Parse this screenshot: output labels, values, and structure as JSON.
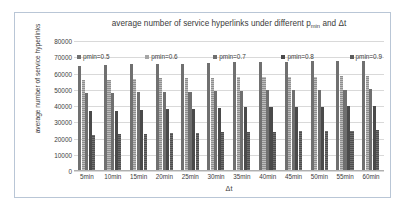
{
  "chart_data": {
    "type": "bar",
    "title": "average number of service hyperlinks under different p",
    "title_sub": "min",
    "title_tail": " and Δt",
    "title_full": "average number of service hyperlinks under different pmin and Δt",
    "xlabel": "Δt",
    "ylabel": "average number of service hyperlinks",
    "categories": [
      "5min",
      "10min",
      "15min",
      "20min",
      "25min",
      "30min",
      "35min",
      "40min",
      "45min",
      "50min",
      "55min",
      "60min"
    ],
    "ylim": [
      0,
      80000
    ],
    "ytick_step": 10000,
    "yticks": [
      "80000",
      "70000",
      "60000",
      "50000",
      "40000",
      "30000",
      "20000",
      "10000",
      "0"
    ],
    "ytick_values": [
      80000,
      70000,
      60000,
      50000,
      40000,
      30000,
      20000,
      10000,
      0
    ],
    "grid": true,
    "legend_position": "top-inside",
    "series": [
      {
        "name": "pmin=0.5",
        "color": "#707070",
        "values": [
          64700,
          65300,
          65900,
          66000,
          66100,
          66400,
          66800,
          67000,
          67300,
          67400,
          67700,
          68000
        ]
      },
      {
        "name": "pmin=0.6",
        "color": "#a6a6a6",
        "values": [
          55900,
          56300,
          56700,
          57000,
          57200,
          57400,
          57600,
          57800,
          58000,
          58100,
          58200,
          58300
        ]
      },
      {
        "name": "pmin=0.7",
        "color": "#6f6f6f",
        "values": [
          48000,
          48200,
          48400,
          48800,
          48800,
          49200,
          49500,
          49600,
          49800,
          49700,
          50000,
          50300
        ]
      },
      {
        "name": "pmin=0.8",
        "color": "#4a4a4a",
        "values": [
          37000,
          37200,
          37600,
          38000,
          38400,
          38700,
          39200,
          39300,
          39500,
          39600,
          39900,
          40100
        ]
      },
      {
        "name": "pmin=0.9",
        "color": "#5c5c5c",
        "values": [
          22300,
          22500,
          23000,
          23200,
          23300,
          23900,
          24000,
          24300,
          24500,
          24600,
          24700,
          25200
        ]
      }
    ]
  }
}
